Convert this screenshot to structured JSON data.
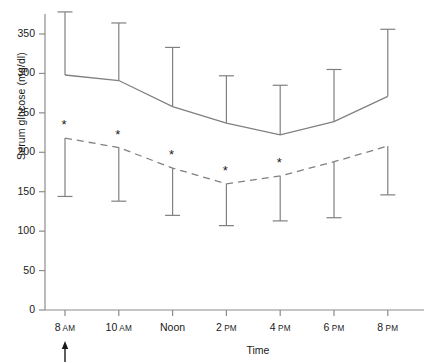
{
  "chart_data": {
    "type": "line",
    "title": "",
    "xlabel": "Time",
    "ylabel": "Serum glucose (mg/dl)",
    "ylim": [
      0,
      385
    ],
    "yticks": [
      0,
      50,
      100,
      150,
      200,
      250,
      300,
      350
    ],
    "ytick_labels": [
      "0",
      "50",
      "100",
      "150",
      "200",
      "250",
      "300",
      "350"
    ],
    "grid": false,
    "legend": "none",
    "categories": [
      "8 AM",
      "10 AM",
      "Noon",
      "2 PM",
      "4 PM",
      "6 PM",
      "8 PM"
    ],
    "xtick_labels": [
      {
        "time": "8",
        "meridiem": "AM"
      },
      {
        "time": "10",
        "meridiem": "AM"
      },
      {
        "time": "Noon",
        "meridiem": ""
      },
      {
        "time": "2",
        "meridiem": "PM"
      },
      {
        "time": "4",
        "meridiem": "PM"
      },
      {
        "time": "6",
        "meridiem": "PM"
      },
      {
        "time": "8",
        "meridiem": "PM"
      }
    ],
    "series": [
      {
        "name": "upper-series-solid",
        "style": "solid",
        "color": "#808080",
        "values": [
          298,
          291,
          258,
          237,
          222,
          239,
          271
        ],
        "error_upper": [
          378,
          364,
          333,
          297,
          285,
          305,
          356
        ],
        "error_lower": [
          298,
          291,
          258,
          237,
          222,
          239,
          271
        ],
        "error_bar_direction": "up"
      },
      {
        "name": "lower-series-dashed",
        "style": "dashed",
        "color": "#808080",
        "values": [
          218,
          206,
          180,
          160,
          170,
          188,
          208
        ],
        "error_upper": [
          218,
          206,
          180,
          160,
          170,
          188,
          208
        ],
        "error_lower": [
          144,
          138,
          120,
          107,
          113,
          117,
          146
        ],
        "error_bar_direction": "down"
      }
    ],
    "annotations": {
      "significance_marker": "*",
      "significance_at": [
        "8 AM",
        "10 AM",
        "Noon",
        "2 PM",
        "4 PM"
      ],
      "arrow_marker": "↑",
      "arrow_at": "8 AM"
    },
    "axis_color": "#8c8c8c",
    "text_color": "#1a1a1a"
  }
}
